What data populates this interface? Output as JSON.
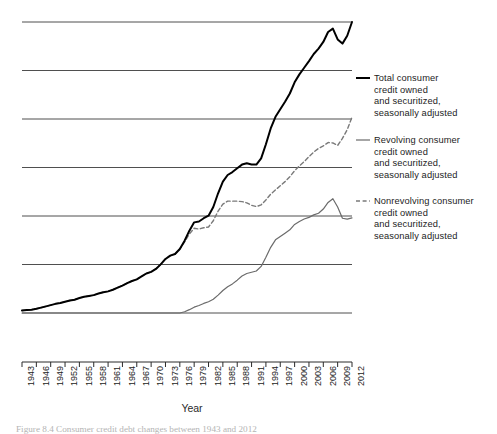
{
  "figure": {
    "caption": "Figure 8.4 Consumer credit debt changes between 1943 and 2012"
  },
  "chart_data": {
    "type": "line",
    "title": "",
    "subtitle": "",
    "xlabel": "Year",
    "ylabel": "",
    "grid": true,
    "gridlines": 7,
    "legend_position": "right",
    "xlim": [
      1943,
      2012
    ],
    "ylim": [
      0,
      7
    ],
    "x_tick_labels": [
      "1943",
      "1946",
      "1949",
      "1952",
      "1955",
      "1958",
      "1961",
      "1964",
      "1967",
      "1970",
      "1973",
      "1976",
      "1979",
      "1982",
      "1985",
      "1988",
      "1991",
      "1994",
      "1997",
      "2000",
      "2003",
      "2006",
      "2009",
      "2012"
    ],
    "y_tick_labels": [],
    "x": [
      1943,
      1944,
      1945,
      1946,
      1947,
      1948,
      1949,
      1950,
      1951,
      1952,
      1953,
      1954,
      1955,
      1956,
      1957,
      1958,
      1959,
      1960,
      1961,
      1962,
      1963,
      1964,
      1965,
      1966,
      1967,
      1968,
      1969,
      1970,
      1971,
      1972,
      1973,
      1974,
      1975,
      1976,
      1977,
      1978,
      1979,
      1980,
      1981,
      1982,
      1983,
      1984,
      1985,
      1986,
      1987,
      1988,
      1989,
      1990,
      1991,
      1992,
      1993,
      1994,
      1995,
      1996,
      1997,
      1998,
      1999,
      2000,
      2001,
      2002,
      2003,
      2004,
      2005,
      2006,
      2007,
      2008,
      2009,
      2010,
      2011,
      2012
    ],
    "series": [
      {
        "name": "Total consumer credit owned and securitized, seasonally adjusted",
        "style": "solid",
        "color": "#000000",
        "width": 2.0,
        "values": [
          0.06,
          0.07,
          0.08,
          0.1,
          0.13,
          0.16,
          0.19,
          0.22,
          0.24,
          0.27,
          0.3,
          0.32,
          0.36,
          0.39,
          0.41,
          0.43,
          0.47,
          0.5,
          0.52,
          0.56,
          0.61,
          0.66,
          0.72,
          0.77,
          0.81,
          0.88,
          0.95,
          0.99,
          1.06,
          1.17,
          1.3,
          1.38,
          1.42,
          1.54,
          1.74,
          1.98,
          2.18,
          2.2,
          2.28,
          2.34,
          2.55,
          2.88,
          3.16,
          3.32,
          3.39,
          3.48,
          3.57,
          3.6,
          3.57,
          3.57,
          3.72,
          4.06,
          4.44,
          4.72,
          4.9,
          5.08,
          5.28,
          5.55,
          5.74,
          5.9,
          6.06,
          6.23,
          6.36,
          6.52,
          6.76,
          6.84,
          6.58,
          6.48,
          6.67,
          7.0
        ]
      },
      {
        "name": "Revolving consumer credit owned and securitized, seasonally adjusted",
        "style": "solid",
        "color": "#6b6b6b",
        "width": 1.2,
        "values": [
          0.0,
          0.0,
          0.0,
          0.0,
          0.0,
          0.0,
          0.0,
          0.0,
          0.0,
          0.0,
          0.0,
          0.0,
          0.0,
          0.0,
          0.0,
          0.0,
          0.0,
          0.0,
          0.0,
          0.0,
          0.0,
          0.0,
          0.0,
          0.0,
          0.0,
          0.0,
          0.0,
          0.0,
          0.0,
          0.0,
          0.0,
          0.0,
          0.0,
          0.0,
          0.03,
          0.08,
          0.14,
          0.18,
          0.23,
          0.27,
          0.33,
          0.43,
          0.54,
          0.63,
          0.7,
          0.79,
          0.89,
          0.95,
          0.98,
          1.01,
          1.12,
          1.34,
          1.58,
          1.76,
          1.84,
          1.92,
          2.0,
          2.13,
          2.2,
          2.26,
          2.3,
          2.36,
          2.4,
          2.5,
          2.66,
          2.75,
          2.55,
          2.28,
          2.26,
          2.29
        ]
      },
      {
        "name": "Nonrevolving consumer credit owned and securitized, seasonally adjusted",
        "style": "dashed",
        "color": "#7a7a7a",
        "width": 1.4,
        "values": [
          0.06,
          0.07,
          0.08,
          0.1,
          0.13,
          0.16,
          0.19,
          0.22,
          0.24,
          0.27,
          0.3,
          0.32,
          0.36,
          0.39,
          0.41,
          0.43,
          0.47,
          0.5,
          0.52,
          0.56,
          0.61,
          0.66,
          0.72,
          0.77,
          0.81,
          0.88,
          0.95,
          0.99,
          1.06,
          1.17,
          1.3,
          1.38,
          1.42,
          1.54,
          1.71,
          1.9,
          2.04,
          2.02,
          2.05,
          2.07,
          2.22,
          2.45,
          2.62,
          2.69,
          2.69,
          2.69,
          2.68,
          2.65,
          2.59,
          2.56,
          2.6,
          2.72,
          2.86,
          2.96,
          3.06,
          3.16,
          3.28,
          3.42,
          3.54,
          3.64,
          3.76,
          3.87,
          3.96,
          4.02,
          4.1,
          4.09,
          4.03,
          4.2,
          4.41,
          4.71
        ]
      }
    ]
  }
}
